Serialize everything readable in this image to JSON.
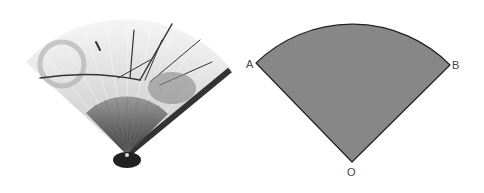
{
  "figure": {
    "left_image": {
      "description": "Folding fan painted with orchids, rock and a moon",
      "colors": {
        "paper": "#eeeeee",
        "ribs": "#555555",
        "ink": "#333333"
      }
    },
    "right_diagram": {
      "shape": "circular sector",
      "labels": {
        "left_point": "A",
        "right_point": "B",
        "center": "O"
      },
      "colors": {
        "fill": "#8a8a8a",
        "stroke": "#222222",
        "label": "#444444"
      }
    }
  }
}
